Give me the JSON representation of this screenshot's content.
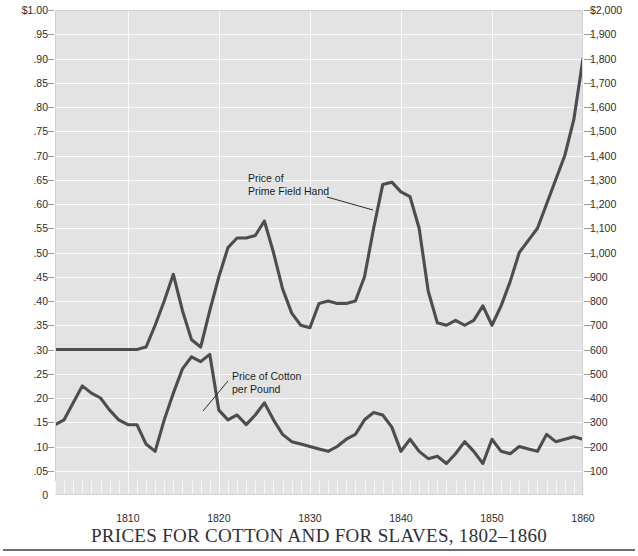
{
  "title": "PRICES FOR COTTON AND FOR SLAVES, 1802–1860",
  "annotations": {
    "slaves": "Price of\nPrime Field Hand",
    "cotton": "Price of Cotton\nper Pound"
  },
  "axes": {
    "left_ticks": [
      "$1.00",
      ".95",
      ".90",
      ".85",
      ".80",
      ".75",
      ".70",
      ".65",
      ".60",
      ".55",
      ".50",
      ".45",
      ".40",
      ".35",
      ".30",
      ".25",
      ".20",
      ".15",
      ".10",
      ".05",
      "0"
    ],
    "right_ticks": [
      "$2,000",
      "1,900",
      "1,800",
      "1,700",
      "1,600",
      "1,500",
      "1,400",
      "1,300",
      "1,200",
      "1,100",
      "1,000",
      "900",
      "800",
      "700",
      "600",
      "500",
      "400",
      "300",
      "200",
      "100",
      ""
    ],
    "x_ticks": [
      "1810",
      "1820",
      "1830",
      "1840",
      "1850",
      "1860"
    ]
  },
  "colors": {
    "plot_background": "#e3e3e3",
    "gridline": "#fafafa",
    "series_line": "#4d4d4d",
    "title_text": "#30303a"
  },
  "chart_data": {
    "type": "line",
    "title": "PRICES FOR COTTON AND FOR SLAVES, 1802–1860",
    "xlabel": "",
    "ylabel": "Price of Cotton per Pound (dollars)",
    "y2label": "Price of Prime Field Hand (dollars)",
    "xlim": [
      1802,
      1860
    ],
    "ylim": [
      0,
      1.0
    ],
    "y2lim": [
      0,
      2000
    ],
    "grid": true,
    "legend": "annotated-inline",
    "x": [
      1802,
      1803,
      1804,
      1805,
      1806,
      1807,
      1808,
      1809,
      1810,
      1811,
      1812,
      1813,
      1814,
      1815,
      1816,
      1817,
      1818,
      1819,
      1820,
      1821,
      1822,
      1823,
      1824,
      1825,
      1826,
      1827,
      1828,
      1829,
      1830,
      1831,
      1832,
      1833,
      1834,
      1835,
      1836,
      1837,
      1838,
      1839,
      1840,
      1841,
      1842,
      1843,
      1844,
      1845,
      1846,
      1847,
      1848,
      1849,
      1850,
      1851,
      1852,
      1853,
      1854,
      1855,
      1856,
      1857,
      1858,
      1859,
      1860
    ],
    "series": [
      {
        "name": "Price of Cotton per Pound",
        "axis": "left",
        "unit": "dollars",
        "values": [
          0.145,
          0.155,
          0.19,
          0.225,
          0.21,
          0.2,
          0.175,
          0.155,
          0.145,
          0.145,
          0.105,
          0.09,
          0.155,
          0.21,
          0.26,
          0.285,
          0.275,
          0.29,
          0.175,
          0.155,
          0.165,
          0.145,
          0.165,
          0.19,
          0.155,
          0.125,
          0.11,
          0.105,
          0.1,
          0.095,
          0.09,
          0.1,
          0.115,
          0.125,
          0.155,
          0.17,
          0.165,
          0.14,
          0.09,
          0.115,
          0.09,
          0.075,
          0.08,
          0.065,
          0.085,
          0.11,
          0.09,
          0.065,
          0.115,
          0.09,
          0.085,
          0.1,
          0.095,
          0.09,
          0.125,
          0.11,
          0.115,
          0.12,
          0.115
        ]
      },
      {
        "name": "Price of Prime Field Hand",
        "axis": "right",
        "unit": "dollars",
        "values": [
          600,
          600,
          600,
          600,
          600,
          600,
          600,
          600,
          600,
          600,
          610,
          700,
          800,
          910,
          760,
          640,
          610,
          760,
          900,
          1020,
          1060,
          1060,
          1070,
          1130,
          1000,
          850,
          750,
          700,
          690,
          790,
          800,
          790,
          790,
          800,
          900,
          1100,
          1280,
          1290,
          1250,
          1230,
          1100,
          840,
          710,
          700,
          720,
          700,
          720,
          780,
          700,
          780,
          880,
          1000,
          1050,
          1100,
          1200,
          1300,
          1400,
          1550,
          1800
        ]
      }
    ]
  }
}
